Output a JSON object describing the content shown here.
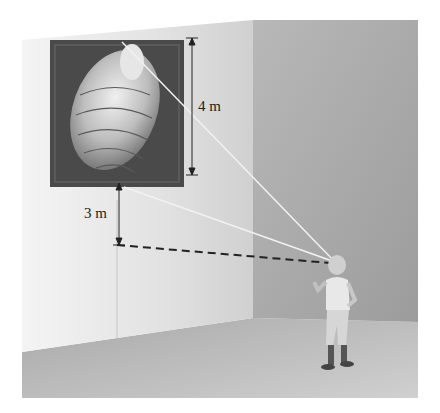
{
  "figure": {
    "labels": {
      "painting_height": "4 m",
      "height_above_eye": "3 m"
    },
    "colors": {
      "left_wall": "#e4e4e4",
      "back_wall": "#a8a8a8",
      "floor": "#b4b4b4",
      "painting_frame": "#4a4a4a",
      "sight_line": "#f2f2f2",
      "dashed_line": "#222222"
    }
  }
}
